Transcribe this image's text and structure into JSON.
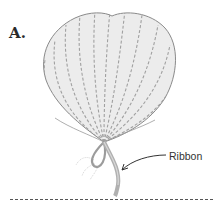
{
  "figure": {
    "label": "A.",
    "callout_label": "Ribbon"
  },
  "colors": {
    "leaf_fill": "#e6e6e6",
    "leaf_vein": "#9a9a9a",
    "ribbon": "#b8b8b8",
    "text": "#333333",
    "divider": "#555555"
  }
}
